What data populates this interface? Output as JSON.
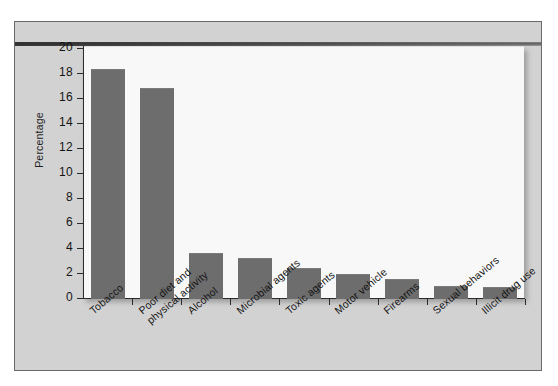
{
  "chart_data": {
    "type": "bar",
    "title": "",
    "subtitle": "",
    "xlabel": "",
    "ylabel": "Percentage",
    "ylim": [
      0,
      20
    ],
    "ytick_step": 2,
    "grid": false,
    "legend": "none",
    "orientation": "vertical",
    "bar_color": "#6d6d6d",
    "plot_background": "#f8f8f8",
    "frame_background": "#d2d2d2",
    "axis_color": "#2b2b2b",
    "categories": [
      "Tobacco",
      "Poor diet and\nphysical activity",
      "Alcohol",
      "Microbial agents",
      "Toxic agents",
      "Motor vehicle",
      "Firearms",
      "Sexual behaviors",
      "Illicit drug use"
    ],
    "values": [
      18.3,
      16.8,
      3.6,
      3.2,
      2.4,
      1.9,
      1.5,
      1.0,
      0.9
    ],
    "ytick_labels": [
      "0",
      "2",
      "4",
      "6",
      "8",
      "10",
      "12",
      "14",
      "16",
      "18",
      "20"
    ],
    "ytick_values": [
      0,
      2,
      4,
      6,
      8,
      10,
      12,
      14,
      16,
      18,
      20
    ]
  }
}
